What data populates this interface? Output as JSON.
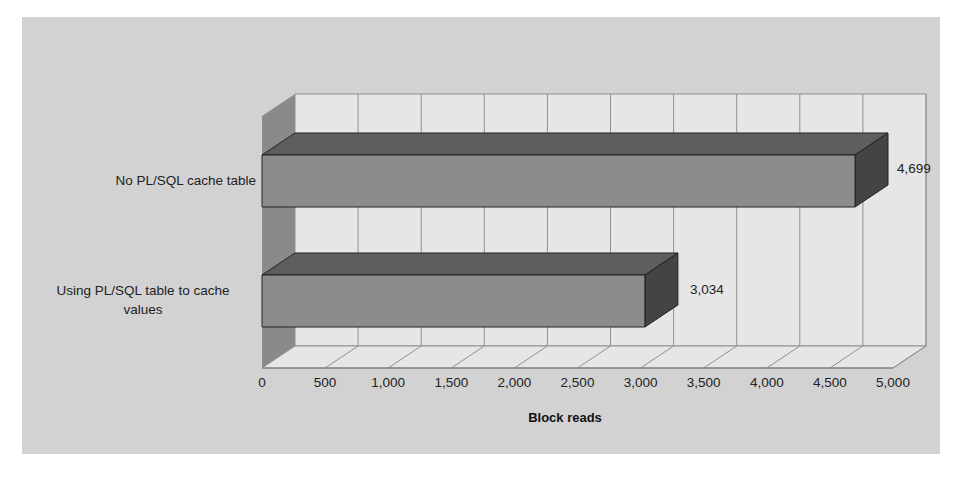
{
  "chart_data": {
    "type": "bar",
    "orientation": "horizontal",
    "style": "3d",
    "title": "",
    "xlabel": "Block reads",
    "ylabel": "",
    "categories": [
      "Using PL/SQL table to cache values",
      "No PL/SQL cache table"
    ],
    "values": [
      3034,
      4699
    ],
    "value_labels": [
      "3,034",
      "4,699"
    ],
    "xlim": [
      0,
      5000
    ],
    "x_ticks": [
      "0",
      "500",
      "1,000",
      "1,500",
      "2,000",
      "2,500",
      "3,000",
      "3,500",
      "4,000",
      "4,500",
      "5,000"
    ],
    "grid": true,
    "legend": null
  },
  "labels": {
    "cat_top_line1": "No PL/SQL cache table",
    "cat_bottom_line1": "Using PL/SQL table to cache",
    "cat_bottom_line2": "values",
    "value_top": "4,699",
    "value_bottom": "3,034",
    "axis_title": "Block reads",
    "ticks": [
      "0",
      "500",
      "1,000",
      "1,500",
      "2,000",
      "2,500",
      "3,000",
      "3,500",
      "4,000",
      "4,500",
      "5,000"
    ]
  },
  "colors": {
    "panel_bg": "#d2d2d2",
    "wall": "#e6e6e6",
    "side_wall": "#8a8a8a",
    "bar_front": "#8c8c8c",
    "bar_top": "#5e5e5e",
    "bar_side": "#444444",
    "grid": "#8f8f8f"
  }
}
